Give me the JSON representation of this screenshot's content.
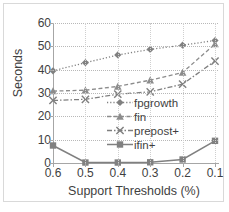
{
  "chart_data": {
    "type": "line",
    "title": "",
    "xlabel": "Support Thresholds (%)",
    "ylabel": "Seconds",
    "categories": [
      "0.6",
      "0.5",
      "0.4",
      "0.3",
      "0.2",
      "0.1"
    ],
    "yticks": [
      0,
      10,
      20,
      30,
      40,
      50,
      60
    ],
    "ylim": [
      0,
      60
    ],
    "grid": true,
    "legend_position": "center-right-inside",
    "series": [
      {
        "name": "fpgrowth",
        "marker": "diamond",
        "linestyle": "dotted",
        "color": "#808080",
        "values": [
          39.5,
          43.0,
          46.3,
          48.7,
          50.5,
          52.5
        ]
      },
      {
        "name": "fin",
        "marker": "triangle",
        "linestyle": "dashed",
        "color": "#8c8c8c",
        "values": [
          30.8,
          31.2,
          32.8,
          35.5,
          38.8,
          51.0
        ]
      },
      {
        "name": "prepost+",
        "marker": "x",
        "linestyle": "dash-dot",
        "color": "#7f7f7f",
        "values": [
          26.8,
          27.3,
          29.5,
          30.5,
          33.8,
          43.7
        ]
      },
      {
        "name": "ifin+",
        "marker": "square",
        "linestyle": "solid",
        "color": "#808080",
        "values": [
          7.5,
          0.2,
          0.2,
          0.3,
          1.5,
          9.5
        ]
      }
    ]
  },
  "axis": {
    "y_tick_labels": [
      "60",
      "50",
      "40",
      "30",
      "20",
      "10",
      "0"
    ],
    "x_tick_labels": [
      "0.6",
      "0.5",
      "0.4",
      "0.3",
      "0.2",
      "0.1"
    ]
  },
  "legend": {
    "items": [
      {
        "label": "fpgrowth",
        "marker": "diamond-marker-icon"
      },
      {
        "label": "fin",
        "marker": "triangle-marker-icon"
      },
      {
        "label": "prepost+",
        "marker": "x-marker-icon"
      },
      {
        "label": "ifin+",
        "marker": "square-marker-icon"
      }
    ]
  }
}
